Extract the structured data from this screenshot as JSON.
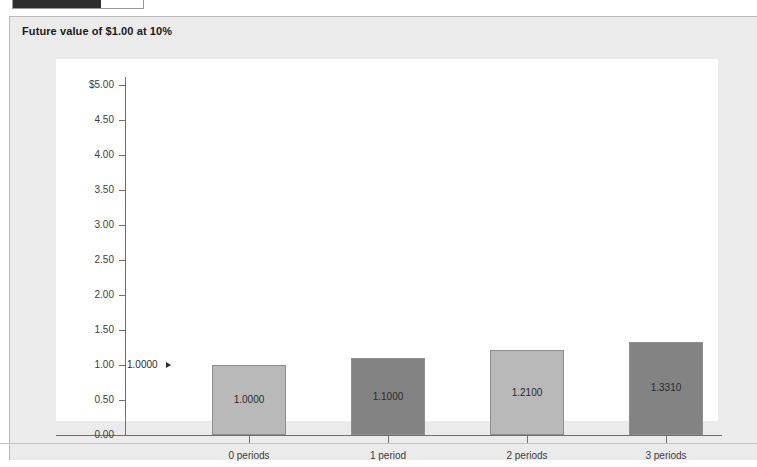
{
  "window": {
    "top_widget": {
      "name": "progress-fragment"
    }
  },
  "panel": {
    "title": "Future value of $1.00 at 10%",
    "background_color": "#ebebeb",
    "plot_background_color": "#ffffff"
  },
  "chart_data": {
    "type": "bar",
    "title": "Future value of $1.00 at 10%",
    "xlabel": "",
    "ylabel": "",
    "categories": [
      "0 periods",
      "1 period",
      "2 periods",
      "3 periods"
    ],
    "values": [
      1.0,
      1.1,
      1.21,
      1.331
    ],
    "data_labels": [
      "1.0000",
      "1.1000",
      "1.2100",
      "1.3310"
    ],
    "bar_colors": [
      "#b9b9b9",
      "#838383",
      "#b9b9b9",
      "#838383"
    ],
    "bar_border_color": "#8e8e8e",
    "ylim": [
      0.0,
      5.0
    ],
    "ytick_step": 0.5,
    "ytick_labels": [
      "$5.00",
      "4.50",
      "4.00",
      "3.50",
      "3.00",
      "2.50",
      "2.00",
      "1.50",
      "1.00",
      "0.50",
      "0.00"
    ],
    "ytick_values": [
      5.0,
      4.5,
      4.0,
      3.5,
      3.0,
      2.5,
      2.0,
      1.5,
      1.0,
      0.5,
      0.0
    ],
    "grid": false,
    "legend": false,
    "annotations": [
      {
        "text": "1.0000",
        "points_to_category": "0 periods",
        "value": 1.0
      }
    ]
  }
}
